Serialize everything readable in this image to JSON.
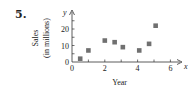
{
  "problem_number": "5.",
  "chart_data": {
    "type": "scatter",
    "title": "",
    "xlabel": "Year",
    "ylabel": "Sales (in millions)",
    "ylabel_line1": "Sales",
    "ylabel_line2": "(in millions)",
    "x_axis_var": "x",
    "y_axis_var": "y",
    "xlim": [
      0,
      6.5
    ],
    "ylim": [
      0,
      27
    ],
    "x_ticks": [
      0,
      2,
      4,
      6
    ],
    "y_ticks": [
      0,
      10,
      20
    ],
    "grid": false,
    "marker": "square",
    "marker_color": "#707070",
    "points": [
      {
        "x": 0.5,
        "y": 2
      },
      {
        "x": 1.0,
        "y": 7
      },
      {
        "x": 2.0,
        "y": 13
      },
      {
        "x": 2.6,
        "y": 12
      },
      {
        "x": 3.1,
        "y": 9
      },
      {
        "x": 4.1,
        "y": 7
      },
      {
        "x": 4.7,
        "y": 11
      },
      {
        "x": 5.1,
        "y": 22
      }
    ]
  }
}
